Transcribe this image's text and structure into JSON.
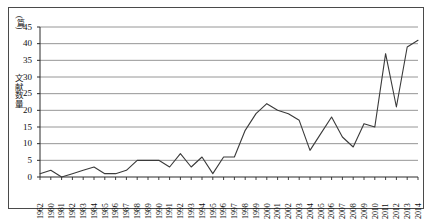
{
  "chart_data": {
    "type": "line",
    "title": "",
    "xlabel": "",
    "ylabel": "文献数量",
    "yunit": "(篇)",
    "ylim": [
      0,
      45
    ],
    "ytick_step": 5,
    "yticks": [
      0,
      5,
      10,
      15,
      20,
      25,
      30,
      35,
      40,
      45
    ],
    "grid": "horizontal",
    "legend": "none",
    "line_color": "#3a3a3a",
    "grid_color": "#8a8a8a",
    "axis_color": "#2a2a2a",
    "categories": [
      "1962",
      "1980",
      "1981",
      "1982",
      "1983",
      "1984",
      "1985",
      "1986",
      "1987",
      "1988",
      "1989",
      "1990",
      "1991",
      "1992",
      "1993",
      "1994",
      "1995",
      "1996",
      "1997",
      "1998",
      "1999",
      "2000",
      "2001",
      "2002",
      "2003",
      "2004",
      "2005",
      "2006",
      "2007",
      "2008",
      "2009",
      "2010",
      "2011",
      "2012",
      "2013",
      "2014"
    ],
    "values": [
      1,
      2,
      0,
      1,
      2,
      3,
      1,
      1,
      2,
      5,
      5,
      5,
      3,
      7,
      3,
      6,
      1,
      6,
      6,
      14,
      19,
      22,
      20,
      19,
      17,
      8,
      13,
      18,
      12,
      9,
      16,
      15,
      37,
      21,
      39,
      41
    ]
  }
}
